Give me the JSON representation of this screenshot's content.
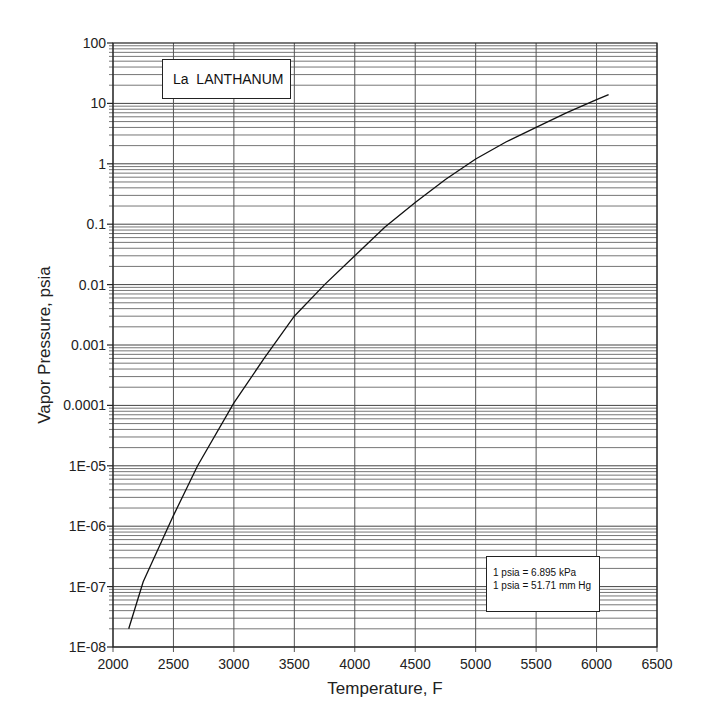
{
  "chart_data": {
    "type": "line",
    "title": "La  LANTHANUM",
    "xlabel": "Temperature, F",
    "ylabel": "Vapor Pressure, psia",
    "xlim": [
      2000,
      6500
    ],
    "ylim": [
      1e-08,
      100
    ],
    "yscale": "log",
    "grid": true,
    "x_ticks": [
      2000,
      2500,
      3000,
      3500,
      4000,
      4500,
      5000,
      5500,
      6000,
      6500
    ],
    "x_tick_labels": [
      "2000",
      "2500",
      "3000",
      "3500",
      "4000",
      "4500",
      "5000",
      "5500",
      "6000",
      "6500"
    ],
    "y_ticks": [
      1e-08,
      1e-07,
      1e-06,
      1e-05,
      0.0001,
      0.001,
      0.01,
      0.1,
      1,
      10,
      100
    ],
    "y_tick_labels": [
      "1E-08",
      "1E-07",
      "1E-06",
      "1E-05",
      "0.0001",
      "0.001",
      "0.01",
      "0.1",
      "1",
      "10",
      "100"
    ],
    "series": [
      {
        "name": "La LANTHANUM",
        "x": [
          2130,
          2250,
          2500,
          2700,
          3000,
          3250,
          3500,
          3750,
          4000,
          4250,
          4500,
          4750,
          5000,
          5250,
          5500,
          5750,
          6000,
          6100
        ],
        "y": [
          2e-08,
          1.2e-07,
          1.5e-06,
          1e-05,
          0.00011,
          0.0006,
          0.003,
          0.01,
          0.03,
          0.09,
          0.23,
          0.55,
          1.2,
          2.3,
          4.0,
          7.0,
          11.5,
          14
        ]
      }
    ],
    "annotations": [
      {
        "text": "La  LANTHANUM",
        "position": "top-left"
      },
      {
        "text": "1 psia = 6.895 kPa",
        "position": "bottom-right"
      },
      {
        "text": "1 psia = 51.71 mm Hg",
        "position": "bottom-right"
      }
    ]
  },
  "label": {
    "element": "La  LANTHANUM"
  },
  "note": {
    "line1": "1 psia = 6.895 kPa",
    "line2": "1 psia = 51.71 mm Hg"
  }
}
